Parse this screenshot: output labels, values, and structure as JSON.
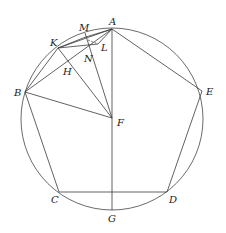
{
  "figure": {
    "colors": {
      "stroke": "#3a3a3a",
      "label": "#222222",
      "background": "#ffffff"
    },
    "circle": {
      "cx": 112,
      "cy": 119,
      "r": 91
    },
    "points": {
      "A": {
        "label": "A",
        "x": 112,
        "y": 29,
        "lx": 109,
        "ly": 25
      },
      "B": {
        "label": "B",
        "x": 25,
        "y": 92,
        "lx": 14,
        "ly": 96
      },
      "C": {
        "label": "C",
        "x": 59,
        "y": 192,
        "lx": 51,
        "ly": 203
      },
      "D": {
        "label": "D",
        "x": 167,
        "y": 192,
        "lx": 169,
        "ly": 203
      },
      "E": {
        "label": "E",
        "x": 202,
        "y": 91,
        "lx": 206,
        "ly": 95
      },
      "F": {
        "label": "F",
        "x": 112,
        "y": 118,
        "lx": 117,
        "ly": 126
      },
      "G": {
        "label": "G",
        "x": 112,
        "y": 210,
        "lx": 108,
        "ly": 222
      },
      "K": {
        "label": "K",
        "x": 58,
        "y": 48,
        "lx": 50,
        "ly": 46
      },
      "M": {
        "label": "M",
        "x": 85,
        "y": 33,
        "lx": 79,
        "ly": 31
      },
      "L": {
        "label": "L",
        "x": 98,
        "y": 44,
        "lx": 101,
        "ly": 51
      },
      "N": {
        "label": "N",
        "x": 90,
        "y": 52,
        "lx": 84,
        "ly": 62
      },
      "H": {
        "label": "H",
        "x": 72,
        "y": 69,
        "lx": 63,
        "ly": 75
      }
    },
    "segments": [
      [
        "A",
        "B"
      ],
      [
        "B",
        "C"
      ],
      [
        "C",
        "D"
      ],
      [
        "D",
        "E"
      ],
      [
        "E",
        "A"
      ],
      [
        "A",
        "G"
      ],
      [
        "B",
        "F"
      ],
      [
        "K",
        "F"
      ],
      [
        "M",
        "F"
      ],
      [
        "K",
        "A"
      ],
      [
        "K",
        "B"
      ],
      [
        "K",
        "L"
      ],
      [
        "B",
        "L"
      ],
      [
        "A",
        "L"
      ]
    ],
    "dashed_segments": [
      [
        "N",
        "L"
      ]
    ],
    "labels": [
      "A",
      "B",
      "C",
      "D",
      "E",
      "F",
      "G",
      "H",
      "K",
      "L",
      "M",
      "N"
    ]
  }
}
